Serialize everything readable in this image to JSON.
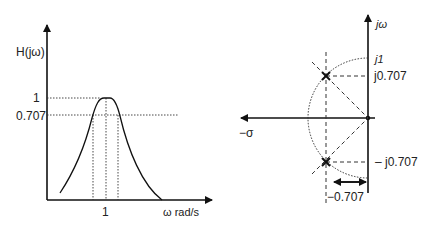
{
  "left_plot": {
    "y_label": "H(jω)",
    "y_ticks": [
      {
        "label": "1",
        "value": 1
      },
      {
        "label": "0.707",
        "value": 0.707
      }
    ],
    "x_ticks": [
      {
        "label": "1",
        "value": 1
      }
    ],
    "x_label": "ω  rad/s",
    "curve": "bandpass magnitude response peaking at 1 near ω = 1, with half-power (0.707) crossings marked by dotted verticals"
  },
  "right_plot": {
    "imag_axis_label": "jω",
    "real_axis_label": "−σ",
    "labels": {
      "j1": "j1",
      "j0707_pos": "j0.707",
      "j0707_neg": "– j0.707",
      "sigma_0707": "−0.707"
    },
    "poles": [
      {
        "real": -0.707,
        "imag": 0.707,
        "marker": "x"
      },
      {
        "real": -0.707,
        "imag": -0.707,
        "marker": "x"
      }
    ],
    "unit_circle": "dotted semicircle of radius 1 in left half-plane"
  },
  "colors": {
    "line": "#111111",
    "background": "#ffffff"
  }
}
